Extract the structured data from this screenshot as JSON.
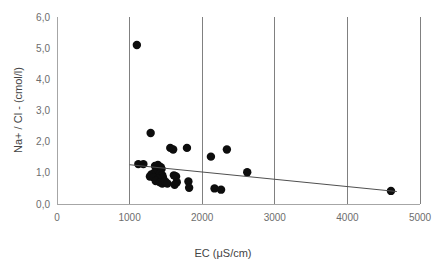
{
  "chart_data": {
    "type": "scatter",
    "title": "",
    "xlabel": "EC (μS/cm)",
    "ylabel": "Na+ / Cl - (cmol/l)",
    "xlim": [
      0,
      5000
    ],
    "ylim": [
      0.0,
      6.0
    ],
    "xticks": [
      0,
      1000,
      2000,
      3000,
      4000,
      5000
    ],
    "xticklabels": [
      "0",
      "1000",
      "2000",
      "3000",
      "4000",
      "5000"
    ],
    "yticks": [
      0.0,
      1.0,
      2.0,
      3.0,
      4.0,
      5.0,
      6.0
    ],
    "yticklabels": [
      "0,0",
      "1,0",
      "2,0",
      "3,0",
      "4,0",
      "5,0",
      "6,0"
    ],
    "grid": "vertical-only",
    "legend": "none",
    "point_color": "#0d0d0d",
    "point_size": 4.2,
    "series": [
      {
        "name": "Na+ / Cl - vs EC",
        "points": [
          [
            1100,
            5.1
          ],
          [
            1290,
            2.28
          ],
          [
            1560,
            1.8
          ],
          [
            1600,
            1.75
          ],
          [
            1790,
            1.8
          ],
          [
            2120,
            1.52
          ],
          [
            2340,
            1.75
          ],
          [
            1120,
            1.28
          ],
          [
            1190,
            1.28
          ],
          [
            1350,
            1.22
          ],
          [
            1390,
            1.25
          ],
          [
            1410,
            1.2
          ],
          [
            1430,
            1.18
          ],
          [
            1440,
            1.12
          ],
          [
            1400,
            1.08
          ],
          [
            1370,
            1.05
          ],
          [
            1340,
            1.0
          ],
          [
            1300,
            0.95
          ],
          [
            1280,
            0.88
          ],
          [
            1330,
            0.86
          ],
          [
            1420,
            0.98
          ],
          [
            1450,
            0.92
          ],
          [
            1460,
            0.84
          ],
          [
            1390,
            0.8
          ],
          [
            1360,
            0.74
          ],
          [
            1420,
            0.7
          ],
          [
            1450,
            0.66
          ],
          [
            1490,
            0.72
          ],
          [
            1520,
            0.66
          ],
          [
            1610,
            0.92
          ],
          [
            1640,
            0.88
          ],
          [
            1650,
            0.7
          ],
          [
            1620,
            0.62
          ],
          [
            1810,
            0.72
          ],
          [
            1820,
            0.52
          ],
          [
            2170,
            0.5
          ],
          [
            2260,
            0.46
          ],
          [
            2620,
            1.02
          ],
          [
            4600,
            0.42
          ]
        ]
      }
    ],
    "trendline": {
      "type": "linear",
      "x_start": 1000,
      "y_start": 1.26,
      "x_end": 4680,
      "y_end": 0.4
    }
  }
}
